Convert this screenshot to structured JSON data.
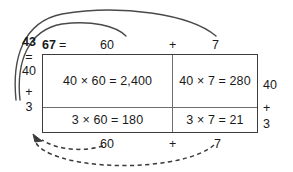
{
  "diagram": {
    "title_number_bold": "67",
    "equals_sign": "=",
    "plus_sign": "+",
    "top": {
      "factor_label": "67",
      "equals": "=",
      "part_a": "60",
      "plus": "+",
      "part_b": "7"
    },
    "left_column": {
      "factor_label": "43",
      "equals": "=",
      "part_a": "40",
      "plus": "+",
      "part_b": "3"
    },
    "right_column": {
      "part_a": "40",
      "plus": "+",
      "part_b": "3"
    },
    "bottom": {
      "part_a": "60",
      "plus": "+",
      "part_b": "7"
    },
    "grid": {
      "rows": [
        {
          "cells": [
            "40 × 60 = 2,400",
            "40 × 7 = 280"
          ]
        },
        {
          "cells": [
            "3 × 60 = 180",
            "3 × 7 = 21"
          ]
        }
      ]
    },
    "arrows": {
      "top_solid_outer": "arc-from-43-to-7",
      "top_solid_inner": "arc-from-43-to-60",
      "bottom_dashed_outer": "arc-from-7-to-3",
      "bottom_dashed_inner": "arc-from-60-to-3"
    },
    "colors": {
      "ink": "#1a1a1a",
      "border_outer": "#3d3d3d",
      "border_inner": "#6e6e6e",
      "arc": "#4a4a4a",
      "background": "#ffffff"
    }
  }
}
